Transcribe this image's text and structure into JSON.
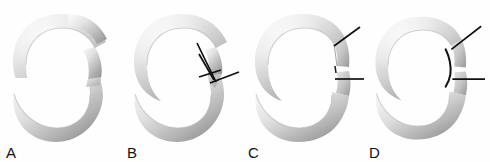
{
  "figure": {
    "background_color": "#fefefe",
    "width": 490,
    "height": 162,
    "panel_count": 4
  },
  "colors": {
    "tube_light": "#f2f2f2",
    "tube_mid": "#c9c9c9",
    "tube_dark": "#9a9a9a",
    "tube_shadow": "#868686",
    "cut_face_light": "#dcdcdc",
    "cut_face_mid": "#b4b4b4",
    "cut_face_dark": "#8f8f8f",
    "leader_line": "#101010",
    "label_text": "#131313",
    "background": "#fefefe"
  },
  "panels": [
    {
      "id": "a",
      "label": "A",
      "caption_letter": "A",
      "cut_type": "single-oblique-gap",
      "leader_lines": 0,
      "description": "C-shaped ring with a single oblique gap on the right side, no annotation lines"
    },
    {
      "id": "b",
      "label": "B",
      "caption_letter": "B",
      "cut_type": "closing-wedge",
      "leader_lines": 3,
      "description": "C-shaped ring with a V-shaped closing wedge cut and three black leader lines converging on the wedge apex"
    },
    {
      "id": "c",
      "label": "C",
      "caption_letter": "C",
      "cut_type": "parallel-segment-resection",
      "leader_lines": 2,
      "description": "C-shaped ring with two parallel cuts isolating a ring segment, two black leader lines"
    },
    {
      "id": "d",
      "label": "D",
      "caption_letter": "D",
      "cut_type": "segment-with-inner-arc",
      "leader_lines": 2,
      "description": "C-shaped ring with an isolated segment plus a dark inner arc marking, two black leader lines"
    }
  ]
}
